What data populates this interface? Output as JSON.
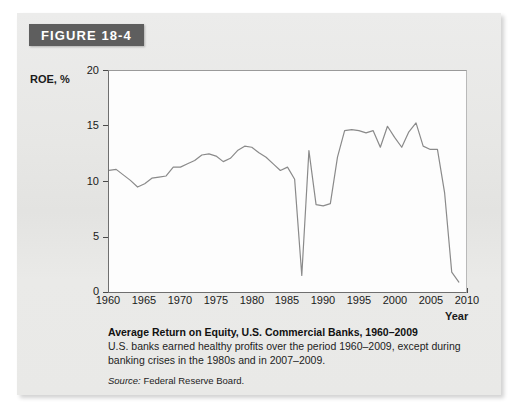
{
  "figure": {
    "banner_label": "FIGURE 18-4",
    "banner_color": "#5e5e5e",
    "panel_color": "#e8e8e6"
  },
  "caption": {
    "title": "Average Return on Equity, U.S. Commercial Banks, 1960–2009",
    "body": "U.S. banks earned healthy profits over the period 1960–2009, except during banking crises in the 1980s and in 2007–2009.",
    "source_label": "Source:",
    "source_text": "Federal Reserve Board."
  },
  "chart_data": {
    "type": "line",
    "title": "Average Return on Equity, U.S. Commercial Banks, 1960–2009",
    "xlabel": "Year",
    "ylabel": "ROE, %",
    "xlim": [
      1960,
      2010
    ],
    "ylim": [
      0,
      20
    ],
    "grid": false,
    "legend": null,
    "line_color": "#8a8a8a",
    "xticks": [
      1960,
      1965,
      1970,
      1975,
      1980,
      1985,
      1990,
      1995,
      2000,
      2005,
      2010
    ],
    "yticks": [
      0,
      5,
      10,
      15,
      20
    ],
    "x": [
      1960,
      1961,
      1962,
      1963,
      1964,
      1965,
      1966,
      1967,
      1968,
      1969,
      1970,
      1971,
      1972,
      1973,
      1974,
      1975,
      1976,
      1977,
      1978,
      1979,
      1980,
      1981,
      1982,
      1983,
      1984,
      1985,
      1986,
      1987,
      1988,
      1989,
      1990,
      1991,
      1992,
      1993,
      1994,
      1995,
      1996,
      1997,
      1998,
      1999,
      2000,
      2001,
      2002,
      2003,
      2004,
      2005,
      2006,
      2007,
      2008,
      2009
    ],
    "values": [
      11.0,
      11.1,
      10.6,
      10.1,
      9.5,
      9.8,
      10.3,
      10.4,
      10.5,
      11.3,
      11.3,
      11.6,
      11.9,
      12.4,
      12.5,
      12.3,
      11.8,
      12.1,
      12.8,
      13.2,
      13.1,
      12.6,
      12.2,
      11.6,
      11.0,
      11.3,
      10.2,
      1.5,
      12.8,
      7.9,
      7.8,
      8.0,
      12.2,
      14.6,
      14.7,
      14.6,
      14.4,
      14.6,
      13.1,
      15.0,
      14.0,
      13.1,
      14.5,
      15.3,
      13.2,
      12.9,
      12.9,
      9.0,
      1.8,
      0.9
    ]
  },
  "axis": {
    "roe_label": "ROE, %",
    "year_label": "Year"
  }
}
